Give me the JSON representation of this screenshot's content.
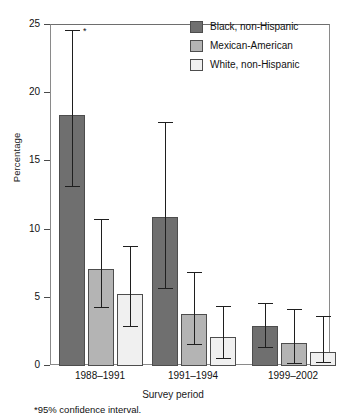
{
  "chart_data": {
    "type": "bar",
    "title": "",
    "subtitle": "",
    "xlabel": "Survey period",
    "ylabel": "Percentage",
    "categories": [
      "1988–1991",
      "1991–1994",
      "1999–2002"
    ],
    "ylim": [
      0,
      25
    ],
    "yticks": [
      0,
      5,
      10,
      15,
      20,
      25
    ],
    "ytick_labels": [
      "0",
      "5",
      "10",
      "15",
      "20",
      "25"
    ],
    "grid": false,
    "legend_position": "top-right",
    "error_bars": "95% confidence interval",
    "annotations": [
      {
        "text": "*",
        "near": "1988–1991 Black, non-Hispanic upper confidence limit"
      }
    ],
    "footnote": "*95% confidence interval.",
    "series": [
      {
        "name": "Black, non-Hispanic",
        "color": "#6f6f6f",
        "values": [
          18.4,
          10.9,
          2.9
        ],
        "ci_low": [
          13.2,
          5.7,
          1.4
        ],
        "ci_high": [
          24.6,
          17.9,
          4.6
        ]
      },
      {
        "name": "Mexican-American",
        "color": "#b4b4b4",
        "values": [
          7.1,
          3.8,
          1.7
        ],
        "ci_low": [
          4.3,
          1.6,
          0.2
        ],
        "ci_high": [
          10.8,
          6.9,
          4.2
        ]
      },
      {
        "name": "White, non-Hispanic",
        "color": "#f0f0f0",
        "values": [
          5.3,
          2.1,
          1.0
        ],
        "ci_low": [
          2.9,
          0.6,
          0.3
        ],
        "ci_high": [
          8.8,
          4.4,
          3.7
        ]
      }
    ]
  },
  "legend": {
    "items": [
      {
        "label": "Black, non-Hispanic",
        "color": "#6f6f6f"
      },
      {
        "label": "Mexican-American",
        "color": "#b4b4b4"
      },
      {
        "label": "White, non-Hispanic",
        "color": "#f0f0f0"
      }
    ]
  },
  "axis": {
    "y_label": "Percentage",
    "x_label": "Survey period"
  },
  "footnote": "*95% confidence interval.",
  "asterisk": "*"
}
